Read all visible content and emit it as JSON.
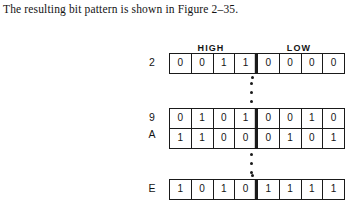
{
  "caption": {
    "text": "The resulting bit pattern is shown in Figure 2–35."
  },
  "figure": {
    "headers": {
      "high": "HIGH",
      "low": "LOW"
    },
    "rows": [
      {
        "label": "2",
        "high": [
          "0",
          "0",
          "1",
          "1"
        ],
        "low": [
          "0",
          "0",
          "0",
          "0"
        ]
      },
      {
        "label": "9",
        "high": [
          "0",
          "1",
          "0",
          "1"
        ],
        "low": [
          "0",
          "0",
          "1",
          "0"
        ]
      },
      {
        "label": "A",
        "high": [
          "1",
          "1",
          "0",
          "0"
        ],
        "low": [
          "0",
          "1",
          "0",
          "1"
        ]
      },
      {
        "label": "E",
        "high": [
          "1",
          "0",
          "1",
          "0"
        ],
        "low": [
          "1",
          "1",
          "1",
          "1"
        ]
      }
    ],
    "ellipsis": "⋮",
    "colors": {
      "ink": "#1a1a1a",
      "paper": "#ffffff"
    }
  }
}
